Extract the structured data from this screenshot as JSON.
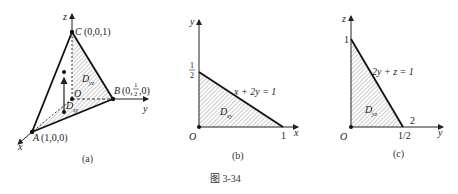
{
  "figure": {
    "caption": "图   3-34",
    "panels": [
      {
        "id": "a",
        "label": "(a)",
        "axes": {
          "x": "x",
          "y": "y",
          "z": "z"
        },
        "points": {
          "A": {
            "name": "A",
            "coords": "(1,0,0)"
          },
          "B": {
            "name": "B",
            "coords_prefix": "(0,",
            "coords_num": "1",
            "coords_den": "2",
            "coords_suffix": ",0)"
          },
          "C": {
            "name": "C",
            "coords": "(0,0,1)"
          },
          "O": {
            "name": "O"
          }
        },
        "regions": {
          "yz": "D",
          "yz_sub": "yz",
          "xy": "D",
          "xy_sub": "xy"
        }
      },
      {
        "id": "b",
        "label": "(b)",
        "axes": {
          "h": "x",
          "v": "y"
        },
        "origin": "O",
        "ticks": {
          "v_num": "1",
          "v_den": "2",
          "h": "1"
        },
        "line_label": "x + 2y = 1",
        "region": "D",
        "region_sub": "xy"
      },
      {
        "id": "c",
        "label": "(c)",
        "axes": {
          "h": "y",
          "v": "z"
        },
        "origin": "O",
        "ticks": {
          "v": "1",
          "h": "1/2",
          "extra": "2"
        },
        "line_label": "2y + z = 1",
        "region": "D",
        "region_sub": "yz"
      }
    ]
  }
}
